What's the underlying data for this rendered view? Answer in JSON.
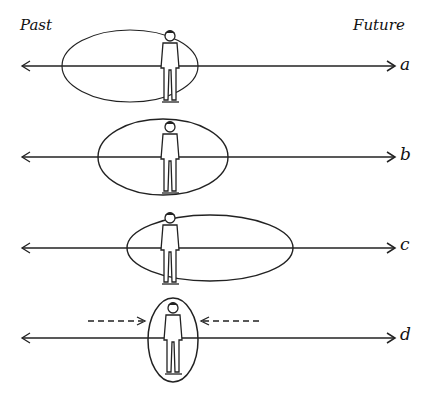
{
  "header": {
    "past_label": "Past",
    "future_label": "Future"
  },
  "rows": [
    {
      "label": "a",
      "y": 66,
      "ellipse": {
        "cx": 130,
        "rx": 68,
        "ry": 36
      },
      "description": "time horizon extends mostly into the past"
    },
    {
      "label": "b",
      "y": 157,
      "ellipse": {
        "cx": 163,
        "rx": 65,
        "ry": 38
      },
      "description": "time horizon balanced between past and future"
    },
    {
      "label": "c",
      "y": 248,
      "ellipse": {
        "cx": 210,
        "rx": 83,
        "ry": 33
      },
      "description": "time horizon extends mostly into the future"
    },
    {
      "label": "d",
      "y": 338,
      "ellipse": {
        "cx": 166,
        "rx": 25,
        "ry": 42
      },
      "description": "time horizon compressed to the present",
      "arrows": [
        "inward-left",
        "inward-right"
      ]
    }
  ],
  "colors": {
    "line": "#222222",
    "background": "#ffffff"
  }
}
